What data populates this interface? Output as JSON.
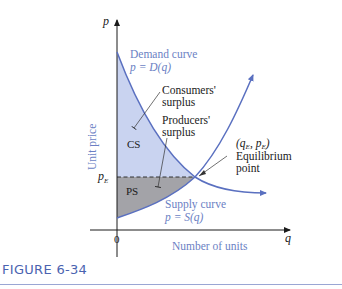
{
  "figure": {
    "caption": "FIGURE 6-34",
    "axes": {
      "y_var": "p",
      "x_var": "q",
      "y_label": "Unit price",
      "x_label": "Number of units",
      "origin_label": "0",
      "pE_label": "p",
      "pE_sub": "E"
    },
    "curves": {
      "demand_line1": "Demand curve",
      "demand_line2": "p = D(q)",
      "supply_line1": "Supply curve",
      "supply_line2": "p = S(q)"
    },
    "regions": {
      "cs": "CS",
      "ps": "PS"
    },
    "annotations": {
      "consumers_line1": "Consumers'",
      "consumers_line2": "surplus",
      "producers_line1": "Producers'",
      "producers_line2": "surplus",
      "eq_coords": "(q",
      "eq_coords_sub1": "E",
      "eq_coords_mid": ", p",
      "eq_coords_sub2": "E",
      "eq_coords_end": ")",
      "eq_line1": "Equilibrium",
      "eq_line2": "point"
    },
    "colors": {
      "curve": "#5a70c0",
      "cs_fill": "#c9d3f0",
      "ps_fill": "#a3a3a8",
      "label_blue": "#6b7fc4",
      "caption": "#4a63b0"
    }
  }
}
